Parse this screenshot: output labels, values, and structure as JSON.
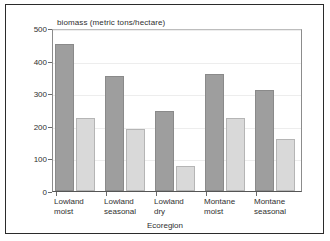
{
  "chart_data": {
    "type": "bar",
    "title": "biomass (metric tons/hectare)",
    "xlabel": "Ecoregion",
    "ylabel": "",
    "categories": [
      "Lowland moist",
      "Lowland seasonal",
      "Lowland dry",
      "Montane moist",
      "Montane seasonal"
    ],
    "category_lines": [
      [
        "Lowland",
        "moist"
      ],
      [
        "Lowland",
        "seasonal"
      ],
      [
        "Lowland",
        "dry"
      ],
      [
        "Montane",
        "moist"
      ],
      [
        "Montane",
        "seasonal"
      ]
    ],
    "series": [
      {
        "name": "Potential",
        "color": "#9e9e9e",
        "values": [
          450,
          352,
          245,
          358,
          310
        ]
      },
      {
        "name": "Actual",
        "color": "#d9d9d9",
        "values": [
          225,
          190,
          78,
          225,
          160
        ]
      }
    ],
    "ylim": [
      0,
      500
    ],
    "yticks": [
      0,
      100,
      200,
      300,
      400,
      500
    ],
    "ytick_labels": [
      "0",
      "100",
      "200",
      "300",
      "400",
      "500"
    ],
    "grid": true,
    "legend_position": "top-center"
  },
  "legend": {
    "items": [
      {
        "label": "Potential"
      },
      {
        "label": "Actual"
      }
    ]
  }
}
